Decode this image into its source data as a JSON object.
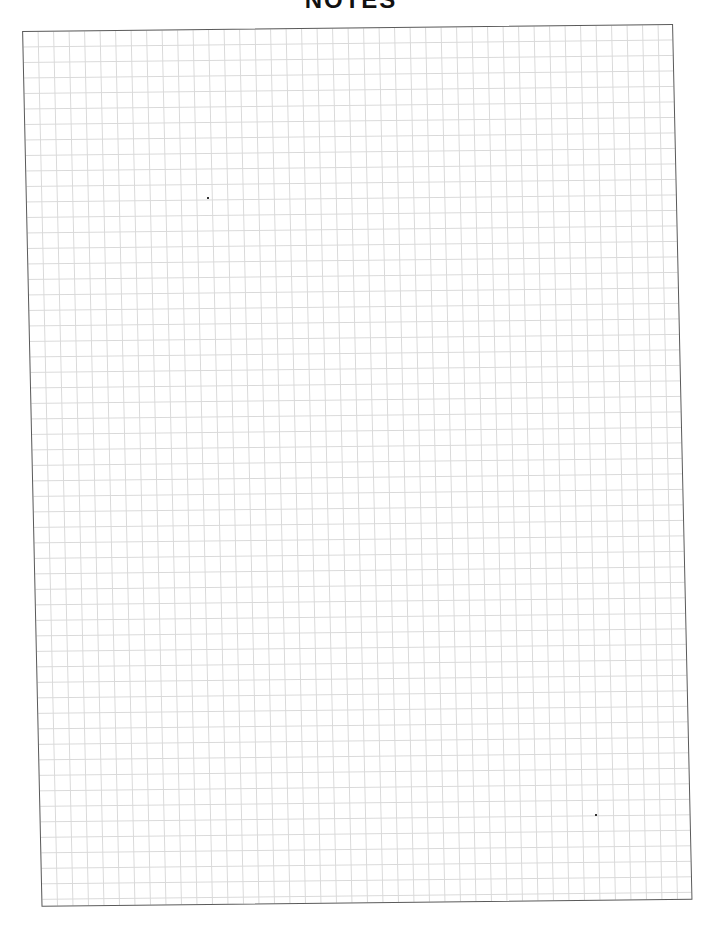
{
  "header": {
    "title": "NOTES"
  },
  "page": {
    "style": "grid",
    "grid_line_color": "#d9d9d9",
    "border_color": "#5a5a5a",
    "content": ""
  }
}
